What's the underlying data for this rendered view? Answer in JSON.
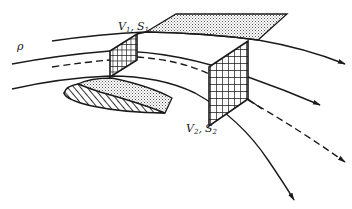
{
  "figure": {
    "labels": {
      "density": "ρ",
      "inlet_v": "V",
      "inlet_v_sub": "1",
      "inlet_sep": ",",
      "inlet_s": "S",
      "inlet_s_sub": "1",
      "outlet_v": "V",
      "outlet_v_sub": "2",
      "outlet_sep": ",",
      "outlet_s": "S",
      "outlet_s_sub": "2"
    },
    "elements": {
      "streamlines": [
        "upper-streamline",
        "middle-streamline",
        "center-dashed-streamline",
        "lower-streamline"
      ],
      "surfaces": [
        "inlet-surface-S1",
        "outlet-surface-S2",
        "top-stream-surface",
        "airfoil"
      ]
    },
    "colors": {
      "ink": "#1a1a1a",
      "background": "#ffffff",
      "stipple": "#9a9a9a"
    }
  }
}
